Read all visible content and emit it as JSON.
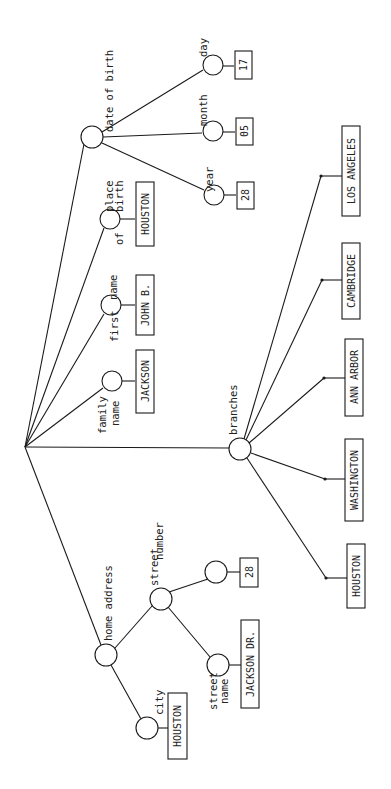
{
  "diagram": {
    "type": "tree",
    "orientation": "rotated-90",
    "root": {
      "x": 25,
      "y": 447
    },
    "nodes": [
      {
        "id": "date_of_birth",
        "label": "date of birth",
        "x": 92,
        "y": 137,
        "parent": "root"
      },
      {
        "id": "day",
        "label": "day",
        "x": 213,
        "y": 65,
        "parent": "date_of_birth",
        "value": "17"
      },
      {
        "id": "month",
        "label": "month",
        "x": 213,
        "y": 131,
        "parent": "date_of_birth",
        "value": "05"
      },
      {
        "id": "year",
        "label": "year",
        "x": 214,
        "y": 195,
        "parent": "date_of_birth",
        "value": "28"
      },
      {
        "id": "place_of_birth",
        "label": "place of birth",
        "x": 110,
        "y": 219,
        "parent": "root",
        "value": "HOUSTON"
      },
      {
        "id": "first_name",
        "label": "first name",
        "x": 111,
        "y": 305,
        "parent": "root",
        "value": "JOHN B."
      },
      {
        "id": "family_name",
        "label": "family name",
        "x": 112,
        "y": 381,
        "parent": "root",
        "value": "JACKSON"
      },
      {
        "id": "branches",
        "label": "branches",
        "x": 240,
        "y": 449,
        "parent": "root"
      },
      {
        "id": "home_address",
        "label": "home address",
        "x": 106,
        "y": 655,
        "parent": "root"
      },
      {
        "id": "street",
        "label": "street",
        "x": 161,
        "y": 599,
        "parent": "home_address"
      },
      {
        "id": "number",
        "label": "number",
        "x": 216,
        "y": 572,
        "parent": "street",
        "value": "28"
      },
      {
        "id": "street_name",
        "label": "street name",
        "x": 218,
        "y": 665,
        "parent": "street",
        "value": "JACKSON DR."
      },
      {
        "id": "city",
        "label": "city",
        "x": 147,
        "y": 728,
        "parent": "home_address",
        "value": "HOUSTON"
      }
    ],
    "branches": [
      {
        "id": "b_la",
        "value": "LOS ANGELES",
        "dot_x": 321,
        "dot_y": 176
      },
      {
        "id": "b_cam",
        "value": "CAMBRIDGE",
        "dot_x": 322,
        "dot_y": 280
      },
      {
        "id": "b_aa",
        "value": "ANN ARBOR",
        "dot_x": 324,
        "dot_y": 378
      },
      {
        "id": "b_wa",
        "value": "WASHINGTON",
        "dot_x": 325,
        "dot_y": 479
      },
      {
        "id": "b_hou",
        "value": "HOUSTON",
        "dot_x": 326,
        "dot_y": 578
      }
    ],
    "labels": {
      "date_of_birth": "date of birth",
      "day": "day",
      "month": "month",
      "year": "year",
      "place": "place",
      "of": "of",
      "birth": "birth",
      "first": "first",
      "name": "name",
      "family": "family",
      "family_name2": "name",
      "branches": "branches",
      "home_address": "home address",
      "street": "street",
      "number": "number",
      "street_name1": "street",
      "street_name2": "name",
      "city": "city"
    },
    "values": {
      "day": "17",
      "month": "05",
      "year": "28",
      "place_of_birth": "HOUSTON",
      "first_name": "JOHN B.",
      "family_name": "JACKSON",
      "number": "28",
      "street_name": "JACKSON DR.",
      "city": "HOUSTON",
      "branch_la": "LOS ANGELES",
      "branch_cambridge": "CAMBRIDGE",
      "branch_annarbor": "ANN ARBOR",
      "branch_washington": "WASHINGTON",
      "branch_houston": "HOUSTON"
    }
  }
}
